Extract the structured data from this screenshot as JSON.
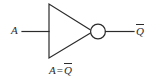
{
  "figure": {
    "background_color": "#ffffff",
    "stroke_color": "#2b2b2b",
    "width": 156,
    "height": 82
  },
  "gate": {
    "type": "inverter",
    "symbol_name": "not-gate-triangle",
    "bubble_name": "inversion-bubble",
    "triangle": {
      "top_vertex": [
        49,
        4
      ],
      "bottom_vertex": [
        49,
        58
      ],
      "apex": [
        93,
        31
      ]
    },
    "bubble": {
      "center": [
        97.5,
        31
      ],
      "radius": 7.5
    }
  },
  "wires": {
    "input": {
      "label": "A",
      "from": [
        22,
        31
      ],
      "to": [
        49,
        31
      ]
    },
    "output": {
      "label": "Q",
      "overbar": true,
      "from": [
        105,
        31
      ],
      "to": [
        134,
        31
      ]
    }
  },
  "labels": {
    "input": "A",
    "output_base": "Q",
    "equation_left": "A",
    "equation_operator": "=",
    "equation_right": "Q"
  }
}
